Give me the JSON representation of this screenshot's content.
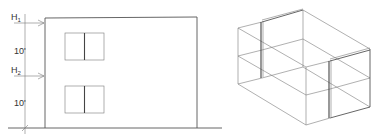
{
  "elevation": {
    "levels": [
      {
        "label": "H",
        "subscript": "1"
      },
      {
        "label": "H",
        "subscript": "2"
      }
    ],
    "dimensions": [
      {
        "value": "10'"
      },
      {
        "value": "10'"
      }
    ],
    "window_count": 2
  },
  "isometric": {
    "description": "Isometric wireframe box with two thick wall panels"
  },
  "colors": {
    "line": "#555555",
    "background": "#ffffff"
  }
}
